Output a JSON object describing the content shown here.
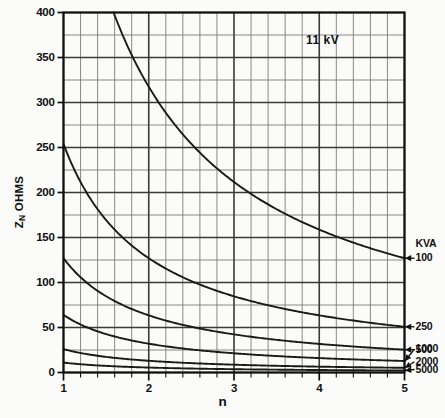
{
  "chart_data": {
    "type": "line",
    "title": "",
    "annotation": "11 kV",
    "xlabel": "n",
    "ylabel": "Z_N OHMS",
    "ylabel_display": "Z",
    "ylabel_sub": "N",
    "ylabel_units": "OHMS",
    "xlim": [
      1,
      5
    ],
    "ylim": [
      0,
      400
    ],
    "xticks": [
      1,
      2,
      3,
      4,
      5
    ],
    "xtick_labels": [
      "1",
      "2",
      "3",
      "4",
      "5"
    ],
    "yticks": [
      0,
      50,
      100,
      150,
      200,
      250,
      300,
      350,
      400
    ],
    "ytick_labels": [
      "0",
      "50",
      "100",
      "150",
      "200",
      "250",
      "300",
      "350",
      "400"
    ],
    "x_minor_step": 0.2,
    "y_minor_step": 25,
    "grid": true,
    "legend_position": "right-inline",
    "legend_title": "KVA",
    "series": [
      {
        "name": "100",
        "label": "100",
        "constant": 635,
        "x": [
          1.0,
          1.2,
          1.4,
          1.6,
          1.8,
          2.0,
          2.2,
          2.4,
          2.6,
          2.8,
          3.0,
          3.2,
          3.4,
          3.6,
          3.8,
          4.0,
          4.2,
          4.4,
          4.6,
          4.8,
          5.0
        ],
        "values": [
          635,
          529,
          454,
          397,
          353,
          318,
          289,
          265,
          244,
          227,
          212,
          198,
          187,
          176,
          167,
          159,
          151,
          144,
          138,
          132,
          127
        ]
      },
      {
        "name": "250",
        "label": "250",
        "constant": 254,
        "x": [
          1.0,
          1.2,
          1.4,
          1.6,
          1.8,
          2.0,
          2.2,
          2.4,
          2.6,
          2.8,
          3.0,
          3.2,
          3.4,
          3.6,
          3.8,
          4.0,
          4.2,
          4.4,
          4.6,
          4.8,
          5.0
        ],
        "values": [
          254,
          212,
          181,
          159,
          141,
          127,
          115,
          106,
          98,
          91,
          85,
          79,
          75,
          71,
          67,
          64,
          60,
          58,
          55,
          53,
          51
        ]
      },
      {
        "name": "500",
        "label": "500",
        "constant": 127,
        "x": [
          1.0,
          1.2,
          1.4,
          1.6,
          1.8,
          2.0,
          2.2,
          2.4,
          2.6,
          2.8,
          3.0,
          3.2,
          3.4,
          3.6,
          3.8,
          4.0,
          4.2,
          4.4,
          4.6,
          4.8,
          5.0
        ],
        "values": [
          127,
          106,
          91,
          79,
          71,
          64,
          58,
          53,
          49,
          45,
          42,
          40,
          37,
          35,
          33,
          32,
          30,
          29,
          28,
          26,
          25
        ]
      },
      {
        "name": "1000",
        "label": "1000",
        "constant": 64,
        "x": [
          1.0,
          1.2,
          1.4,
          1.6,
          1.8,
          2.0,
          2.2,
          2.4,
          2.6,
          2.8,
          3.0,
          3.2,
          3.4,
          3.6,
          3.8,
          4.0,
          4.2,
          4.4,
          4.6,
          4.8,
          5.0
        ],
        "values": [
          64,
          53,
          45,
          40,
          35,
          32,
          29,
          26,
          24,
          23,
          21,
          20,
          19,
          18,
          17,
          16,
          15,
          14,
          14,
          13,
          13
        ]
      },
      {
        "name": "2000",
        "label": "2000",
        "constant": 26,
        "x": [
          1.0,
          1.2,
          1.4,
          1.6,
          1.8,
          2.0,
          2.2,
          2.4,
          2.6,
          2.8,
          3.0,
          3.2,
          3.4,
          3.6,
          3.8,
          4.0,
          4.2,
          4.4,
          4.6,
          4.8,
          5.0
        ],
        "values": [
          26,
          22,
          19,
          16,
          14,
          13,
          12,
          11,
          10,
          9,
          9,
          8,
          8,
          7,
          7,
          6,
          6,
          6,
          6,
          5,
          5
        ]
      },
      {
        "name": "5000",
        "label": "5000",
        "constant": 11,
        "x": [
          1.0,
          1.2,
          1.4,
          1.6,
          1.8,
          2.0,
          2.2,
          2.4,
          2.6,
          2.8,
          3.0,
          3.2,
          3.4,
          3.6,
          3.8,
          4.0,
          4.2,
          4.4,
          4.6,
          4.8,
          5.0
        ],
        "values": [
          11,
          9,
          8,
          7,
          6,
          5,
          5,
          4,
          4,
          4,
          4,
          3,
          3,
          3,
          3,
          3,
          3,
          2,
          2,
          2,
          2
        ]
      }
    ],
    "colors": {
      "line": "#1a1a1a",
      "grid_major": "#3a3a3a",
      "grid_minor": "#7c7c7c",
      "axis": "#101010",
      "background": "#fbfbf9"
    }
  }
}
